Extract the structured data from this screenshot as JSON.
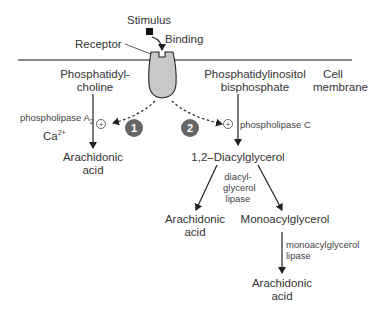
{
  "diagram": {
    "stimulus": "Stimulus",
    "binding": "Binding",
    "receptor": "Receptor",
    "membrane": [
      "Cell",
      "membrane"
    ],
    "pathway1": {
      "number": "1",
      "substrate": [
        "Phosphatidyl-",
        "choline"
      ],
      "enzyme": "phospholipase A",
      "enzyme_sub": "2",
      "cofactor": "Ca",
      "cofactor_sup": "2+",
      "stimulation": "+",
      "product": [
        "Arachidonic",
        "acid"
      ]
    },
    "pathway2": {
      "number": "2",
      "substrate": [
        "Phosphatidylinositol",
        "bisphosphate"
      ],
      "enzyme": "phospholipase C",
      "stimulation": "+",
      "intermediate": "1,2–Diacylglycerol",
      "branch_enzyme": [
        "diacyl-",
        "glycerol",
        "lipase"
      ],
      "branch_product_left": [
        "Arachidonic",
        "acid"
      ],
      "branch_product_right": "Monoacylglycerol",
      "final_enzyme": [
        "monoacylglycerol",
        "lipase"
      ],
      "final_product": [
        "Arachidonic",
        "acid"
      ]
    }
  },
  "colors": {
    "membrane": "#888888",
    "receptor_fill": "#c8c8c8",
    "badge": "#666666",
    "line": "#222222"
  }
}
